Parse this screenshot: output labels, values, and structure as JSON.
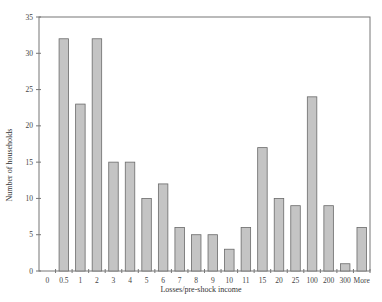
{
  "chart_data": {
    "type": "bar",
    "title": "",
    "xlabel": "Losses/pre-shock income",
    "ylabel": "Number of households",
    "categories": [
      "0",
      "0.5",
      "1",
      "2",
      "3",
      "4",
      "5",
      "6",
      "7",
      "8",
      "9",
      "10",
      "11",
      "15",
      "20",
      "25",
      "100",
      "200",
      "300",
      "More"
    ],
    "values": [
      0,
      32,
      23,
      32,
      15,
      15,
      10,
      12,
      6,
      5,
      5,
      3,
      6,
      17,
      10,
      9,
      24,
      9,
      1,
      6
    ],
    "ylim": [
      0,
      35
    ],
    "yticks": [
      0,
      5,
      10,
      15,
      20,
      25,
      30,
      35
    ],
    "grid": false,
    "legend": null,
    "colors": {
      "bar_fill": "#c4c4c4",
      "bar_stroke": "#6a6a6a",
      "axis": "#777777"
    }
  }
}
